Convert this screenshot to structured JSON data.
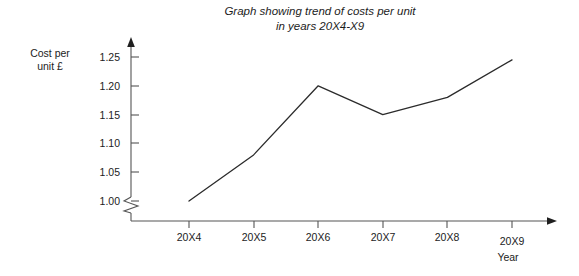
{
  "chart_data": {
    "type": "line",
    "title": "Graph showing trend of costs per unit\nin years 20X4-X9",
    "xlabel": "Year",
    "ylabel": "Cost per\nunit £",
    "categories": [
      "20X4",
      "20X5",
      "20X6",
      "20X7",
      "20X8",
      "20X9"
    ],
    "values": [
      1.0,
      1.08,
      1.2,
      1.15,
      1.18,
      1.245
    ],
    "series": [
      {
        "name": "Cost per unit",
        "values": [
          1.0,
          1.08,
          1.2,
          1.15,
          1.18,
          1.245
        ]
      }
    ],
    "ylim": [
      0.975,
      1.265
    ],
    "y_ticks": [
      "1.00",
      "1.05",
      "1.10",
      "1.15",
      "1.20",
      "1.25"
    ],
    "y_tick_values": [
      1.0,
      1.05,
      1.1,
      1.15,
      1.2,
      1.25
    ],
    "x_ticks": [
      "20X4",
      "20X5",
      "20X6",
      "20X7",
      "20X8",
      "20X9"
    ],
    "grid": false,
    "legend": "none",
    "axis_break": "y-axis zigzag below 1.00",
    "line_color": "#2b2b2b",
    "axis_color": "#555555",
    "background_color": "#ffffff"
  },
  "axis": {
    "y_title": "Cost per\nunit £",
    "x_title": "Year"
  }
}
